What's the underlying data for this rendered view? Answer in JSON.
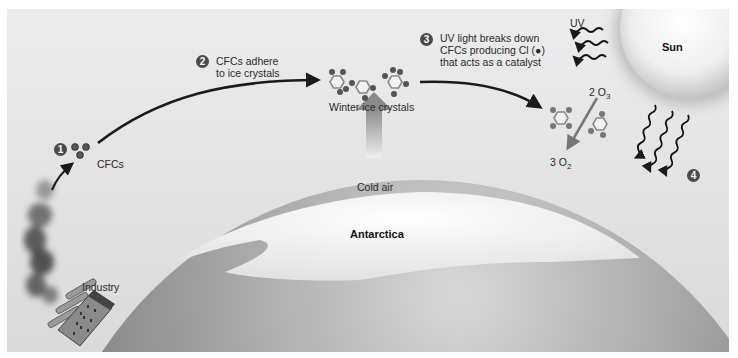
{
  "diagram": {
    "steps": [
      {
        "number": "1",
        "label": "CFCs"
      },
      {
        "number": "2",
        "label_line1": "CFCs adhere",
        "label_line2": "to ice crystals"
      },
      {
        "number": "3",
        "label_line1": "UV light breaks down",
        "label_line2": "CFCs producing Cl (●)",
        "label_line3": "that acts as a catalyst"
      },
      {
        "number": "4",
        "label": ""
      }
    ],
    "labels": {
      "industry": "Industry",
      "winter_ice_crystals": "Winter ice crystals",
      "cold_air": "Cold air",
      "antarctica": "Antarctica",
      "sun": "Sun",
      "uv": "UV",
      "reaction_in": "2 O",
      "reaction_in_sub": "3",
      "reaction_out": "3 O",
      "reaction_out_sub": "2"
    },
    "colors": {
      "background": "#e6e6e6",
      "arrow": "#1a1a1a",
      "badge": "#4a4a4a",
      "sun": "#f4f4f4",
      "globe_dark": "#7a7a7a",
      "ice": "#f7f7f7"
    }
  }
}
